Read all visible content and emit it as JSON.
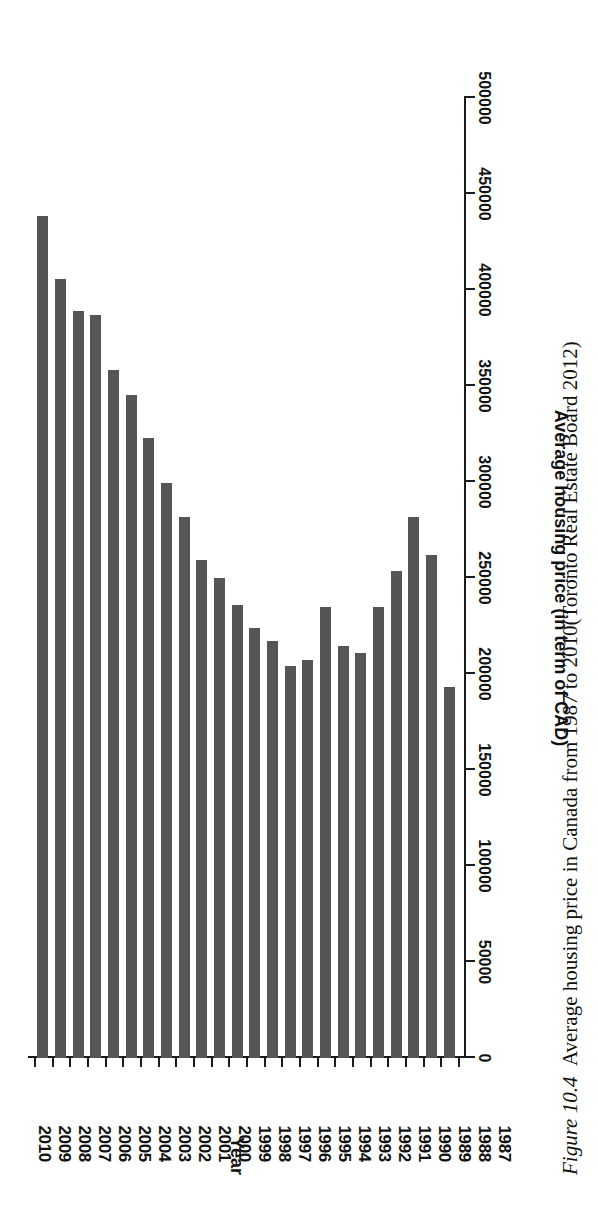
{
  "figure": {
    "caption_prefix": "Figure 10.4",
    "caption_text": "Average housing price in Canada from 1987 to 2010(Toronto Real Estate Board 2012)"
  },
  "axes": {
    "category_title": "Year",
    "value_title": "Average housing price (in term of CAD)",
    "value_ticks": [
      "0",
      "50000",
      "100000",
      "150000",
      "200000",
      "250000",
      "300000",
      "350000",
      "400000",
      "450000",
      "500000"
    ]
  },
  "style": {
    "bar_color": "#555555",
    "axis_color": "#1a1a1a",
    "background": "#ffffff"
  },
  "chart_data": {
    "type": "bar",
    "orientation": "horizontal",
    "title": "Average housing price in Canada from 1987 to 2010",
    "xlabel": "Average housing price (in term of CAD)",
    "ylabel": "Year",
    "xlim": [
      0,
      500000
    ],
    "grid": false,
    "legend": null,
    "categories": [
      "2010",
      "2009",
      "2008",
      "2007",
      "2006",
      "2005",
      "2004",
      "2003",
      "2002",
      "2001",
      "2000",
      "1999",
      "1998",
      "1997",
      "1996",
      "1995",
      "1994",
      "1993",
      "1992",
      "1991",
      "1990",
      "1989",
      "1988",
      "1987"
    ],
    "values": [
      438700,
      405700,
      389200,
      386800,
      358500,
      345500,
      323100,
      299500,
      281800,
      259400,
      250000,
      235800,
      224100,
      217000,
      204000,
      207500,
      234700,
      214600,
      211100,
      234700,
      253500,
      281800,
      261800,
      193400
    ],
    "source": "Toronto Real Estate Board 2012"
  }
}
